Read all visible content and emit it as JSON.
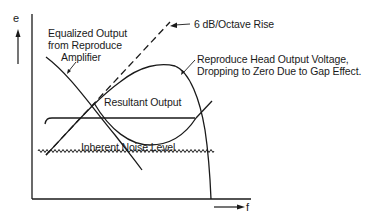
{
  "axes": {
    "y_label": "e",
    "x_label": "f"
  },
  "labels": {
    "equalized_line1": "Equalized Output",
    "equalized_line2": "from Reproduce",
    "equalized_line3": "Amplifier",
    "rise": "6 dB/Octave Rise",
    "head_line1": "Reproduce Head Output Voltage,",
    "head_line2": "Dropping to Zero Due to Gap Effect.",
    "resultant": "Resultant Output",
    "noise": "Inherent Noise Level"
  },
  "colors": {
    "ink": "#1a1a1a",
    "background": "#ffffff"
  }
}
